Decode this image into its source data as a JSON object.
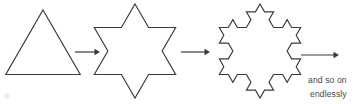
{
  "figure": {
    "background_color": "#ffffff",
    "stroke_color": "#3a3a3a",
    "text_color": "#46464a",
    "width": 356,
    "height": 104
  },
  "caption": {
    "line1": "and so on",
    "line2": "endlessly"
  },
  "shapes": [
    {
      "name": "equilateral-triangle",
      "label": "stage-0",
      "iteration": 0,
      "sides": 3,
      "center_x": 43,
      "center_y": 53,
      "radius": 43
    },
    {
      "name": "star-of-david",
      "label": "stage-1",
      "iteration": 1,
      "sides": 12,
      "center_x": 135,
      "center_y": 51,
      "radius": 47
    },
    {
      "name": "koch-snowflake",
      "label": "stage-2",
      "iteration": 2,
      "sides": 48,
      "center_x": 260,
      "center_y": 51,
      "radius": 47
    }
  ],
  "arrows": [
    {
      "name": "arrow-1",
      "x1": 75,
      "y1": 52,
      "x2": 100,
      "y2": 52
    },
    {
      "name": "arrow-2",
      "x1": 181,
      "y1": 52,
      "x2": 210,
      "y2": 52
    },
    {
      "name": "arrow-3",
      "x1": 301,
      "y1": 55,
      "x2": 339,
      "y2": 55
    }
  ]
}
